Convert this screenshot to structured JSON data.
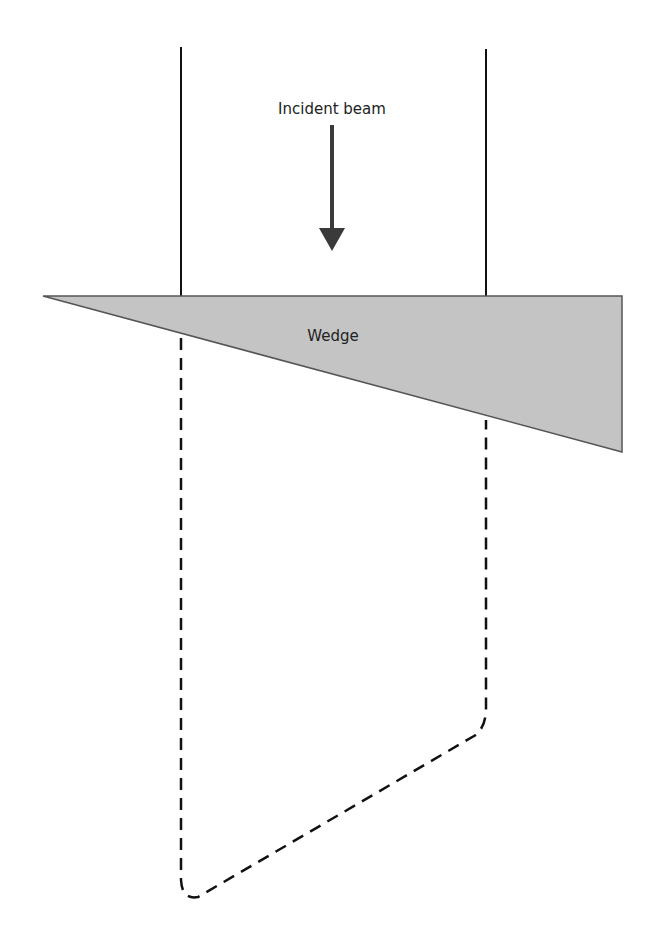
{
  "diagram": {
    "labels": {
      "incident_beam": "Incident beam",
      "wedge": "Wedge"
    },
    "colors": {
      "line": "#111111",
      "arrow": "#3a3a3a",
      "wedge_fill": "#c4c4c4",
      "wedge_stroke": "#555555"
    }
  }
}
